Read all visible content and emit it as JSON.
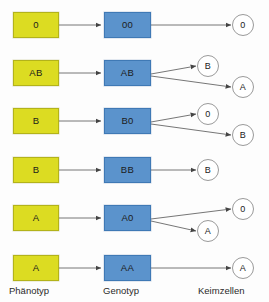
{
  "diagram": {
    "title_columns": {
      "phenotype": "Phänotyp",
      "genotype": "Genotyp",
      "gametes": "Keimzellen"
    },
    "colors": {
      "phenotype_fill": "#dcdc22",
      "phenotype_stroke": "#b3b31a",
      "genotype_fill": "#5b93cc",
      "genotype_stroke": "#3f79b5",
      "gamete_fill": "#ffffff",
      "gamete_stroke": "#9a9a9a",
      "arrow": "#555555",
      "background": "#fdfdfd"
    },
    "rows": [
      {
        "phenotype": "0",
        "genotype": "00",
        "gametes": [
          "0"
        ]
      },
      {
        "phenotype": "AB",
        "genotype": "AB",
        "gametes": [
          "B",
          "A"
        ]
      },
      {
        "phenotype": "B",
        "genotype": "B0",
        "gametes": [
          "0",
          "B"
        ]
      },
      {
        "phenotype": "B",
        "genotype": "BB",
        "gametes": [
          "B"
        ]
      },
      {
        "phenotype": "A",
        "genotype": "A0",
        "gametes": [
          "0",
          "A"
        ]
      },
      {
        "phenotype": "A",
        "genotype": "AA",
        "gametes": [
          "A"
        ]
      }
    ]
  }
}
